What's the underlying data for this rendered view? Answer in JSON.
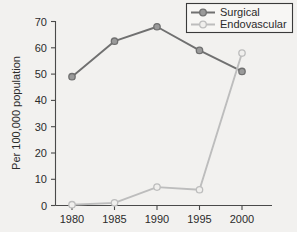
{
  "chart_data": {
    "type": "line",
    "title": "",
    "xlabel": "",
    "ylabel": "Per 100,000 population",
    "x": [
      1980,
      1985,
      1990,
      1995,
      2000
    ],
    "xticklabels": [
      "1980",
      "1985",
      "1990",
      "1995",
      "2000"
    ],
    "yticks": [
      0,
      10,
      20,
      30,
      40,
      50,
      60,
      70
    ],
    "yticklabels": [
      "0",
      "10",
      "20",
      "30",
      "40",
      "50",
      "60",
      "70"
    ],
    "ylim": [
      0,
      70
    ],
    "grid": false,
    "legend_position": "top-right",
    "series": [
      {
        "name": "Surgical",
        "color": "#707070",
        "marker": "circle",
        "values": [
          49,
          62.5,
          68,
          59,
          51
        ]
      },
      {
        "name": "Endovascular",
        "color": "#bdbdbd",
        "marker": "circle",
        "values": [
          0.3,
          1,
          7,
          6,
          58
        ]
      }
    ]
  },
  "legend": {
    "items": [
      {
        "label": "Surgical",
        "color": "#707070"
      },
      {
        "label": "Endovascular",
        "color": "#bdbdbd"
      }
    ]
  },
  "axes": {
    "y_title": "Per 100,000 population",
    "y_labels": [
      "70",
      "60",
      "50",
      "40",
      "30",
      "20",
      "10",
      "0"
    ],
    "x_labels": [
      "1980",
      "1985",
      "1990",
      "1995",
      "2000"
    ]
  },
  "colors": {
    "background": "#f2f1ef",
    "axis": "#4a4a4a",
    "text": "#2b2b2b",
    "surgical": "#707070",
    "endovascular": "#bdbdbd"
  }
}
